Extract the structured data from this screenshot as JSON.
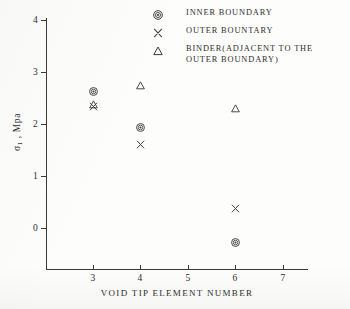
{
  "chart_data": {
    "type": "scatter",
    "title": "",
    "xlabel": "VOID TIP ELEMENT NUMBER",
    "ylabel": "σ₁ , Mpa",
    "xlim": [
      2.3,
      7.5
    ],
    "ylim": [
      -0.78,
      4.15
    ],
    "xticks": [
      3,
      4,
      5,
      6,
      7
    ],
    "yticks": [
      0,
      1,
      2,
      3,
      4
    ],
    "grid": false,
    "legend_position": "top-right",
    "series": [
      {
        "name": "INNER BOUNDARY",
        "marker": "bullseye",
        "x": [
          3,
          4,
          6
        ],
        "y": [
          2.62,
          1.93,
          -0.27
        ]
      },
      {
        "name": "OUTER BOUNTARY",
        "marker": "x-cross",
        "x": [
          3,
          4,
          6
        ],
        "y": [
          2.33,
          1.6,
          0.37
        ]
      },
      {
        "name": "BINDER(ADJACENT TO THE OUTER BOUNDARY)",
        "marker": "triangle",
        "x": [
          3,
          4,
          6
        ],
        "y": [
          2.37,
          2.75,
          2.3
        ]
      }
    ]
  },
  "axes": {
    "y_title_main": "σ",
    "y_title_sub": "1",
    "y_title_rest": " , Mpa",
    "x_title": "VOID TIP ELEMENT NUMBER",
    "x_tick_labels": [
      "3",
      "4",
      "5",
      "6",
      "7"
    ],
    "y_tick_labels": [
      "0",
      "1",
      "2",
      "3",
      "4"
    ]
  },
  "legend": {
    "entries": [
      {
        "marker": "bullseye-marker-icon",
        "label": "INNER BOUNDARY",
        "label_line2": ""
      },
      {
        "marker": "x-cross-marker-icon",
        "label": "OUTER BOUNTARY",
        "label_line2": ""
      },
      {
        "marker": "triangle-marker-icon",
        "label": "BINDER(ADJACENT TO THE",
        "label_line2": "OUTER BOUNDARY)"
      }
    ]
  },
  "colors": {
    "ink": "#2e2e2e",
    "axis": "#3a3a3a",
    "paper": "#fdfdfc"
  }
}
